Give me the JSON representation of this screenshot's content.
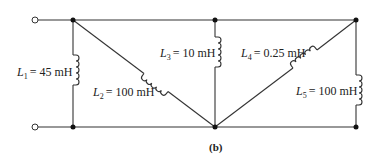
{
  "diagram": {
    "caption": "(b)",
    "inductors": [
      {
        "id": "L1",
        "symbol": "L",
        "subscript": "1",
        "value": "= 45 mH"
      },
      {
        "id": "L2",
        "symbol": "L",
        "subscript": "2",
        "value": "= 100 mH"
      },
      {
        "id": "L3",
        "symbol": "L",
        "subscript": "3",
        "value": "= 10 mH"
      },
      {
        "id": "L4",
        "symbol": "L",
        "subscript": "4",
        "value": "= 0.25 mH"
      },
      {
        "id": "L5",
        "symbol": "L",
        "subscript": "5",
        "value": "= 100 mH"
      }
    ],
    "terminals": [
      "input-top",
      "input-bottom"
    ],
    "colors": {
      "line": "#333333",
      "text": "#222222",
      "background": "#ffffff"
    }
  }
}
